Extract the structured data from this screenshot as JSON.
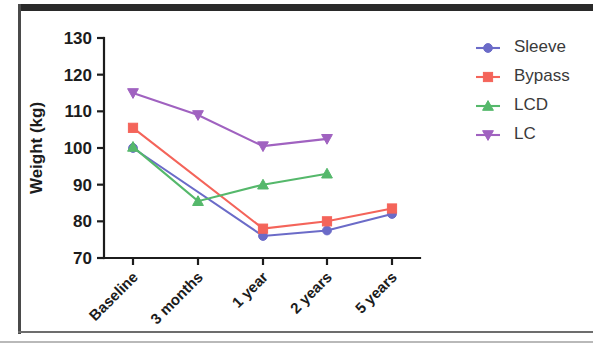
{
  "chart_data": {
    "type": "line",
    "title": "",
    "xlabel": "",
    "ylabel": "Weight (kg)",
    "categories": [
      "Baseline",
      "3 months",
      "1 year",
      "2 years",
      "5 years"
    ],
    "ylim": [
      70,
      130
    ],
    "yticks": [
      70,
      80,
      90,
      100,
      110,
      120,
      130
    ],
    "ytick_labels": [
      "70",
      "80",
      "90",
      "100",
      "110",
      "120",
      "130"
    ],
    "grid": false,
    "legend_position": "right",
    "series": [
      {
        "name": "Sleeve",
        "color": "#6b6bc8",
        "marker": "circle",
        "values": [
          100.0,
          null,
          76.0,
          77.5,
          82.0
        ],
        "x_indices": [
          0,
          2,
          3,
          4
        ]
      },
      {
        "name": "Bypass",
        "color": "#f4645a",
        "marker": "square",
        "values": [
          105.5,
          null,
          78.0,
          80.0,
          83.5
        ],
        "x_indices": [
          0,
          2,
          3,
          4
        ]
      },
      {
        "name": "LCD",
        "color": "#55b86b",
        "marker": "triangle-up",
        "values": [
          100.3,
          85.5,
          90.0,
          93.0,
          null
        ],
        "x_indices": [
          0,
          1,
          2,
          3
        ]
      },
      {
        "name": "LC",
        "color": "#a062c0",
        "marker": "triangle-down",
        "values": [
          115.0,
          109.0,
          100.5,
          102.5,
          null
        ],
        "x_indices": [
          0,
          1,
          2,
          3
        ]
      }
    ]
  },
  "legend": {
    "items": [
      {
        "label": "Sleeve",
        "color": "#6b6bc8",
        "marker": "circle"
      },
      {
        "label": "Bypass",
        "color": "#f4645a",
        "marker": "square"
      },
      {
        "label": "LCD",
        "color": "#55b86b",
        "marker": "triangle-up"
      },
      {
        "label": "LC",
        "color": "#a062c0",
        "marker": "triangle-down"
      }
    ]
  },
  "axis": {
    "y_title": "Weight (kg)"
  }
}
